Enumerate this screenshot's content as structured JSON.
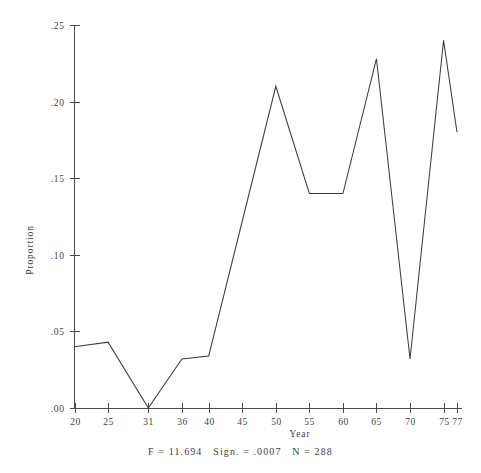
{
  "chart_data": {
    "type": "line",
    "title": "",
    "subtitle": "",
    "xlabel": "Year",
    "ylabel": "Proportion",
    "x": [
      20,
      25,
      31,
      36,
      40,
      50,
      55,
      60,
      65,
      70,
      75,
      77
    ],
    "values": [
      0.04,
      0.043,
      0.0,
      0.032,
      0.034,
      0.21,
      0.14,
      0.14,
      0.228,
      0.032,
      0.24,
      0.18
    ],
    "xtick_labels": [
      "20",
      "25",
      "31",
      "36",
      "40",
      "45",
      "50",
      "55",
      "60",
      "65",
      "70",
      "75",
      "77"
    ],
    "xtick_values": [
      20,
      25,
      31,
      36,
      40,
      45,
      50,
      55,
      60,
      65,
      70,
      75,
      77
    ],
    "ytick_labels": [
      ".00",
      ".05",
      ".10",
      ".15",
      ".20",
      ".25"
    ],
    "ytick_values": [
      0.0,
      0.05,
      0.1,
      0.15,
      0.2,
      0.25
    ],
    "xlim": [
      20,
      77
    ],
    "ylim": [
      0.0,
      0.25
    ],
    "grid": false,
    "legend": null,
    "series": [
      {
        "name": "Proportion",
        "x": [
          20,
          25,
          31,
          36,
          40,
          50,
          55,
          60,
          65,
          70,
          75,
          77
        ],
        "values": [
          0.04,
          0.043,
          0.0,
          0.032,
          0.034,
          0.21,
          0.14,
          0.14,
          0.228,
          0.032,
          0.24,
          0.18
        ]
      }
    ],
    "annotations": []
  },
  "caption": {
    "text": "F = 11.694   Sign. = .0007   N = 288",
    "f_statistic": "F = 11.694",
    "significance": "Sign. = .0007",
    "sample_size": "N = 288"
  },
  "colors": {
    "line": "#3c3c3c",
    "axis": "#4a4a4a",
    "text": "#3f3f3f",
    "background": "#ffffff"
  }
}
